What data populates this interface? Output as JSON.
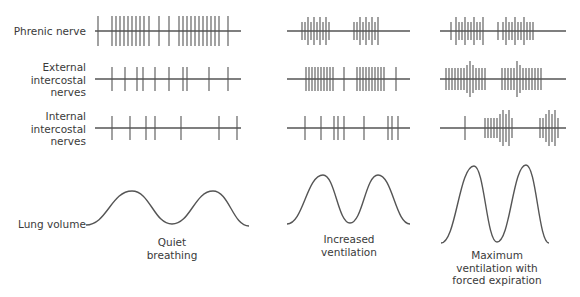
{
  "rows": [
    {
      "id": "phrenic",
      "label": "Phrenic nerve",
      "y": 31
    },
    {
      "id": "external",
      "label": "External intercostal nerves",
      "lines": [
        "External",
        "intercostal",
        "nerves"
      ],
      "y": 79
    },
    {
      "id": "internal",
      "label": "Internal intercostal nerves",
      "lines": [
        "Internal",
        "intercostal",
        "nerves"
      ],
      "y": 128
    }
  ],
  "lung_label": "Lung volume",
  "columns": [
    {
      "id": "quiet",
      "caption_lines": [
        "Quiet",
        "breathing"
      ],
      "caption_x": 172,
      "caption_y": 238,
      "x0": 95,
      "x1": 241,
      "spikes": {
        "phrenic": [
          [
            98,
            15
          ],
          [
            112,
            15
          ],
          [
            116,
            15
          ],
          [
            120,
            15
          ],
          [
            124,
            15
          ],
          [
            128,
            15
          ],
          [
            132,
            15
          ],
          [
            136,
            15
          ],
          [
            140,
            15
          ],
          [
            144,
            15
          ],
          [
            149,
            15
          ],
          [
            159,
            15
          ],
          [
            169,
            15
          ],
          [
            179,
            15
          ],
          [
            183,
            15
          ],
          [
            187,
            15
          ],
          [
            191,
            15
          ],
          [
            195,
            15
          ],
          [
            199,
            15
          ],
          [
            203,
            15
          ],
          [
            207,
            15
          ],
          [
            211,
            15
          ],
          [
            215,
            15
          ],
          [
            219,
            15
          ],
          [
            228,
            15
          ]
        ],
        "external": [
          [
            112,
            12
          ],
          [
            125,
            12
          ],
          [
            137,
            12
          ],
          [
            143,
            12
          ],
          [
            155,
            12
          ],
          [
            169,
            12
          ],
          [
            183,
            12
          ],
          [
            187,
            12
          ],
          [
            209,
            12
          ],
          [
            228,
            12
          ]
        ],
        "internal": [
          [
            112,
            12
          ],
          [
            130,
            12
          ],
          [
            146,
            12
          ],
          [
            155,
            12
          ],
          [
            181,
            12
          ],
          [
            219,
            12
          ],
          [
            237,
            12
          ]
        ]
      },
      "curve": {
        "x0": 86,
        "base": 225,
        "peaks": [
          [
            132,
            191
          ],
          [
            213,
            191
          ]
        ],
        "trough": [
          172,
          224
        ],
        "end": [
          249,
          226
        ]
      }
    },
    {
      "id": "increased",
      "caption_lines": [
        "Increased",
        "ventilation"
      ],
      "caption_x": 349,
      "caption_y": 232,
      "x0": 287,
      "x1": 410,
      "spikes": {
        "phrenic": [
          [
            302,
            9
          ],
          [
            305,
            9
          ],
          [
            308,
            14
          ],
          [
            311,
            9
          ],
          [
            314,
            14
          ],
          [
            317,
            9
          ],
          [
            320,
            14
          ],
          [
            323,
            9
          ],
          [
            326,
            14
          ],
          [
            329,
            9
          ],
          [
            354,
            9
          ],
          [
            357,
            9
          ],
          [
            360,
            14
          ],
          [
            363,
            9
          ],
          [
            366,
            14
          ],
          [
            369,
            9
          ],
          [
            372,
            14
          ],
          [
            375,
            9
          ],
          [
            378,
            14
          ]
        ],
        "external": [
          [
            306,
            12
          ],
          [
            309,
            12
          ],
          [
            312,
            12
          ],
          [
            315,
            12
          ],
          [
            318,
            12
          ],
          [
            321,
            12
          ],
          [
            324,
            12
          ],
          [
            327,
            12
          ],
          [
            330,
            12
          ],
          [
            333,
            12
          ],
          [
            344,
            12
          ],
          [
            357,
            12
          ],
          [
            360,
            12
          ],
          [
            363,
            12
          ],
          [
            366,
            12
          ],
          [
            369,
            12
          ],
          [
            372,
            12
          ],
          [
            375,
            12
          ],
          [
            378,
            12
          ],
          [
            381,
            12
          ],
          [
            384,
            12
          ],
          [
            396,
            12
          ]
        ],
        "internal": [
          [
            305,
            12
          ],
          [
            321,
            12
          ],
          [
            334,
            12
          ],
          [
            338,
            12
          ],
          [
            344,
            12
          ],
          [
            364,
            12
          ],
          [
            388,
            12
          ],
          [
            392,
            12
          ],
          [
            398,
            12
          ]
        ]
      },
      "curve": {
        "x0": 287,
        "base": 224,
        "peaks": [
          [
            323,
            175
          ],
          [
            378,
            175
          ]
        ],
        "trough": [
          350,
          223
        ],
        "end": [
          410,
          224
        ]
      }
    },
    {
      "id": "maximum",
      "caption_lines": [
        "Maximum",
        "ventilation with",
        "forced expiration"
      ],
      "caption_x": 497,
      "caption_y": 250,
      "x0": 440,
      "x1": 566,
      "spikes": {
        "phrenic": [
          [
            451,
            9
          ],
          [
            456,
            14
          ],
          [
            459,
            9
          ],
          [
            462,
            9
          ],
          [
            465,
            14
          ],
          [
            468,
            9
          ],
          [
            471,
            9
          ],
          [
            474,
            14
          ],
          [
            477,
            9
          ],
          [
            480,
            9
          ],
          [
            483,
            14
          ],
          [
            498,
            9
          ],
          [
            503,
            9
          ],
          [
            506,
            14
          ],
          [
            509,
            9
          ],
          [
            512,
            9
          ],
          [
            515,
            14
          ],
          [
            518,
            9
          ],
          [
            521,
            9
          ],
          [
            524,
            14
          ],
          [
            527,
            9
          ],
          [
            530,
            9
          ],
          [
            533,
            9
          ]
        ],
        "external": [
          [
            446,
            11
          ],
          [
            449,
            11
          ],
          [
            452,
            11
          ],
          [
            455,
            11
          ],
          [
            458,
            11
          ],
          [
            461,
            11
          ],
          [
            464,
            11
          ],
          [
            467,
            14
          ],
          [
            470,
            18
          ],
          [
            473,
            14
          ],
          [
            476,
            11
          ],
          [
            479,
            11
          ],
          [
            482,
            11
          ],
          [
            485,
            11
          ],
          [
            502,
            11
          ],
          [
            505,
            11
          ],
          [
            508,
            11
          ],
          [
            511,
            11
          ],
          [
            514,
            11
          ],
          [
            517,
            18
          ],
          [
            520,
            14
          ],
          [
            523,
            11
          ],
          [
            526,
            11
          ],
          [
            529,
            11
          ],
          [
            532,
            11
          ],
          [
            535,
            11
          ],
          [
            538,
            11
          ],
          [
            541,
            11
          ]
        ],
        "internal": [
          [
            465,
            12
          ],
          [
            485,
            10
          ],
          [
            488,
            10
          ],
          [
            491,
            10
          ],
          [
            494,
            10
          ],
          [
            497,
            10
          ],
          [
            500,
            14
          ],
          [
            503,
            18
          ],
          [
            506,
            14
          ],
          [
            509,
            18
          ],
          [
            512,
            10
          ],
          [
            540,
            10
          ],
          [
            543,
            10
          ],
          [
            546,
            14
          ],
          [
            549,
            18
          ],
          [
            552,
            14
          ],
          [
            555,
            18
          ],
          [
            558,
            10
          ]
        ]
      },
      "curve": {
        "x0": 441,
        "base": 243,
        "peaks": [
          [
            474,
            166
          ],
          [
            526,
            165
          ]
        ],
        "trough": [
          497,
          242
        ],
        "end": [
          549,
          243
        ]
      }
    }
  ],
  "colors": {
    "stroke": "#555555",
    "text": "#3a3a3a"
  }
}
